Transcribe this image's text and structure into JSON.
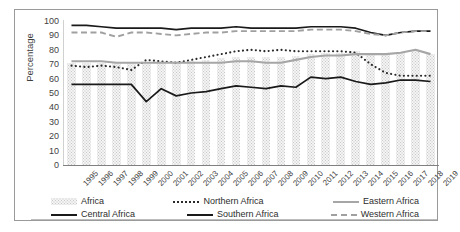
{
  "chart_data": {
    "type": "line",
    "title": "",
    "xlabel": "",
    "ylabel": "Percentage",
    "ylim": [
      0,
      100
    ],
    "ytick_step": 10,
    "yticks": [
      100,
      90,
      80,
      70,
      60,
      50,
      40,
      30,
      20,
      10,
      0
    ],
    "grid": false,
    "legend_position": "bottom",
    "categories": [
      "1995",
      "1996",
      "1997",
      "1998",
      "1999",
      "2000",
      "2001",
      "2002",
      "2003",
      "2004",
      "2005",
      "2006",
      "2007",
      "2008",
      "2009",
      "2010",
      "2011",
      "2012",
      "2013",
      "2014",
      "2015",
      "2016",
      "2017",
      "2018",
      "2019"
    ],
    "series": [
      {
        "name": "Africa",
        "type": "bar",
        "color": "#c9c9c9",
        "pattern": "crosshatch",
        "values": [
          71,
          71,
          71,
          71,
          71,
          71,
          71,
          72,
          72,
          73,
          74,
          75,
          75,
          75,
          75,
          76,
          77,
          78,
          78,
          79,
          77,
          77,
          78,
          80,
          77
        ]
      },
      {
        "name": "Northern Africa",
        "type": "line",
        "style": "dotted",
        "color": "#2b2b2b",
        "values": [
          69,
          68,
          69,
          68,
          66,
          73,
          72,
          71,
          73,
          75,
          77,
          79,
          80,
          79,
          80,
          79,
          79,
          79,
          79,
          78,
          70,
          64,
          62,
          62,
          62
        ]
      },
      {
        "name": "Eastern Africa",
        "type": "line",
        "style": "solid",
        "color": "#a6a6a6",
        "values": [
          72,
          72,
          72,
          71,
          71,
          71,
          71,
          71,
          71,
          71,
          71,
          72,
          72,
          71,
          71,
          73,
          75,
          76,
          76,
          77,
          77,
          77,
          78,
          80,
          77
        ]
      },
      {
        "name": "Central Africa",
        "type": "line",
        "style": "solid",
        "color": "#1a1a1a",
        "values": [
          97,
          97,
          96,
          95,
          95,
          95,
          95,
          94,
          95,
          95,
          95,
          96,
          95,
          95,
          95,
          95,
          96,
          96,
          96,
          95,
          92,
          90,
          92,
          93,
          93
        ]
      },
      {
        "name": "Southern Africa",
        "type": "line",
        "style": "solid",
        "color": "#1a1a1a",
        "values": [
          56,
          56,
          56,
          56,
          56,
          44,
          53,
          48,
          50,
          51,
          53,
          55,
          54,
          53,
          55,
          54,
          61,
          60,
          61,
          58,
          56,
          57,
          59,
          59,
          58
        ]
      },
      {
        "name": "Western Africa",
        "type": "line",
        "style": "dashed",
        "color": "#a0a0a0",
        "values": [
          92,
          92,
          92,
          89,
          92,
          92,
          91,
          90,
          91,
          92,
          92,
          93,
          93,
          93,
          93,
          93,
          94,
          94,
          94,
          93,
          91,
          90,
          92,
          93,
          93
        ]
      }
    ]
  },
  "axis": {
    "y_title": "Percentage"
  },
  "legend": {
    "row1": [
      {
        "label": "Africa",
        "swatch": "bar-swatch"
      },
      {
        "label": "Northern Africa",
        "swatch": "dotted-line-swatch"
      },
      {
        "label": "Eastern Africa",
        "swatch": "gray-line-swatch"
      }
    ],
    "row2": [
      {
        "label": "Central Africa",
        "swatch": "black-line-swatch"
      },
      {
        "label": "Southern Africa",
        "swatch": "black-line-swatch"
      },
      {
        "label": "Western Africa",
        "swatch": "dashed-line-swatch"
      }
    ]
  }
}
